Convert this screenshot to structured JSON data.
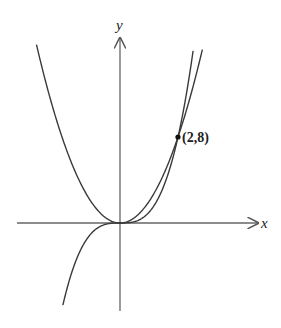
{
  "chart_data": {
    "type": "line",
    "title": "",
    "xlabel": "x",
    "ylabel": "y",
    "grid": false,
    "legend": null,
    "series": [
      {
        "name": "parabola",
        "equation": "y = 2x^2"
      },
      {
        "name": "cubic",
        "equation": "y = x^3"
      }
    ],
    "annotations": [
      {
        "label": "(2,8)",
        "x": 2,
        "y": 8,
        "marker": "dot"
      }
    ]
  },
  "labels": {
    "x_axis": "x",
    "y_axis": "y",
    "point": "(2,8)"
  },
  "colors": {
    "curve": "#333333",
    "axis": "#555555"
  }
}
